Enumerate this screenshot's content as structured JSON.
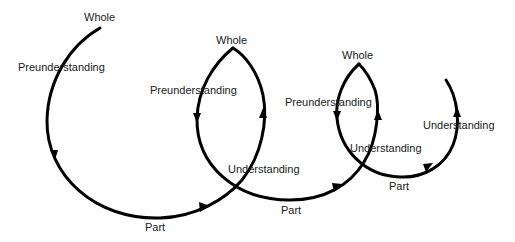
{
  "diagram": {
    "type": "hermeneutic-spiral",
    "stroke_color": "#000000",
    "labels": [
      {
        "id": "whole-1",
        "text": "Whole",
        "x": 84,
        "y": 12
      },
      {
        "id": "preunderstanding-1",
        "text": "Preunderstanding",
        "x": 18,
        "y": 62
      },
      {
        "id": "part-1",
        "text": "Part",
        "x": 145,
        "y": 222
      },
      {
        "id": "whole-2",
        "text": "Whole",
        "x": 216,
        "y": 35
      },
      {
        "id": "preunderstanding-2",
        "text": "Preunderstanding",
        "x": 150,
        "y": 85
      },
      {
        "id": "understanding-1",
        "text": "Understanding",
        "x": 228,
        "y": 164
      },
      {
        "id": "part-2",
        "text": "Part",
        "x": 281,
        "y": 205
      },
      {
        "id": "whole-3",
        "text": "Whole",
        "x": 342,
        "y": 50
      },
      {
        "id": "preunderstanding-3",
        "text": "Preunderstanding",
        "x": 285,
        "y": 97
      },
      {
        "id": "understanding-2",
        "text": "Understanding",
        "x": 350,
        "y": 143
      },
      {
        "id": "part-3",
        "text": "Part",
        "x": 389,
        "y": 181
      },
      {
        "id": "understanding-3",
        "text": "Understanding",
        "x": 423,
        "y": 120
      }
    ]
  }
}
